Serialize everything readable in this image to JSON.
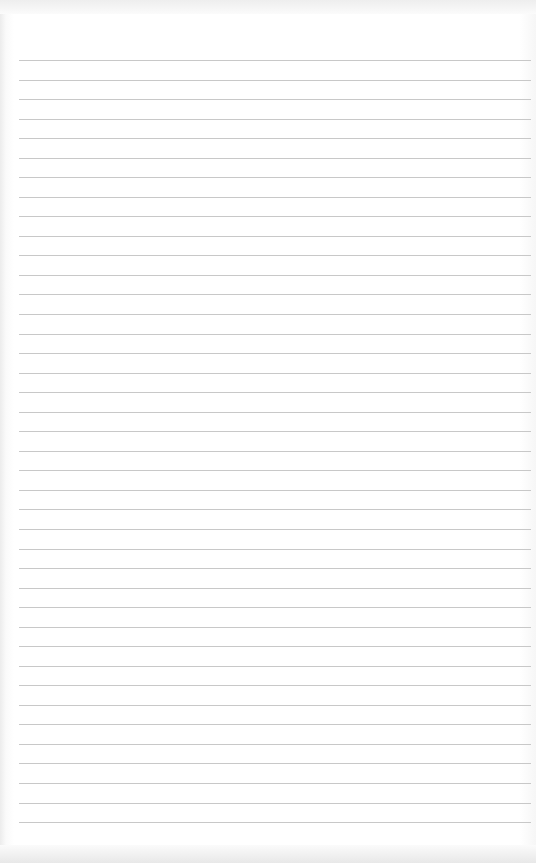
{
  "paper": {
    "type": "lined-paper",
    "line_count": 40,
    "first_line_y": 60,
    "line_spacing": 19.54,
    "line_color": "#c8c8c8",
    "background_color": "#ffffff"
  }
}
